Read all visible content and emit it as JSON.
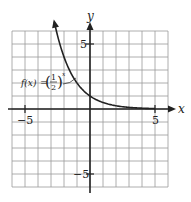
{
  "chart_data": {
    "type": "line",
    "title": "",
    "function_label": {
      "name": "f(x)",
      "equals": "=",
      "base_numerator": "1",
      "base_denominator": "2",
      "exponent": "x"
    },
    "xlabel": "x",
    "ylabel": "y",
    "xlim": [
      -6,
      6
    ],
    "ylim": [
      -6,
      6
    ],
    "grid": true,
    "grid_step": 1,
    "tick_labels": {
      "x": [
        {
          "value": -5,
          "label": "−5"
        },
        {
          "value": 5,
          "label": "5"
        }
      ],
      "y": [
        {
          "value": 5,
          "label": "5"
        },
        {
          "value": -5,
          "label": "−5"
        }
      ]
    },
    "series": [
      {
        "name": "f(x) = (1/2)^x",
        "x": [
          -2.75,
          -2.5,
          -2,
          -1.5,
          -1,
          -0.5,
          0,
          0.5,
          1,
          1.5,
          2,
          2.5,
          3,
          3.5,
          4,
          4.5,
          5
        ],
        "y": [
          6.73,
          5.66,
          4,
          2.83,
          2,
          1.41,
          1,
          0.71,
          0.5,
          0.35,
          0.25,
          0.18,
          0.125,
          0.09,
          0.0625,
          0.044,
          0.031
        ]
      }
    ]
  },
  "colors": {
    "background": "#ffffff",
    "grid": "#9a9a9a",
    "axis": "#222222",
    "curve": "#222222"
  }
}
